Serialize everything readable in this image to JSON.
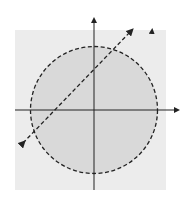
{
  "figure": {
    "x_axis_label": "x",
    "y_axis_label": "y",
    "x_ticks": [
      "-5",
      "-4",
      "-3",
      "-2",
      "-1",
      "1",
      "2",
      "3",
      "4",
      "5"
    ],
    "y_ticks": [
      "5",
      "4",
      "3",
      "2",
      "1",
      "-1",
      "-2",
      "-3",
      "-4",
      "-5"
    ],
    "curves": [
      {
        "name": "circle",
        "equation": "x^2 + y^2 = 25",
        "style": "dashed"
      },
      {
        "name": "hyperbola",
        "equation": "x^2/9 - y^2/32 = 1",
        "style": "dashed"
      },
      {
        "name": "line",
        "equation": "y = x + 3",
        "style": "dashed"
      }
    ],
    "colors": {
      "dark_shade": "#a9a9a9",
      "light_shade": "#d9d9d9",
      "background": "#ececec",
      "white_region": "#ffffff",
      "curve": "#222222"
    }
  }
}
